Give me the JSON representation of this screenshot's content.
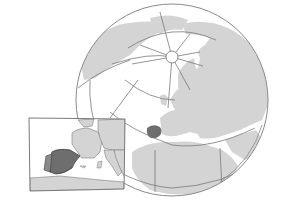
{
  "map": {
    "type": "locator-globe",
    "projection": "orthographic",
    "highlighted_region": "Iberian Peninsula",
    "colors": {
      "background": "#ffffff",
      "ocean": "#ffffff",
      "land": "#d4d4d4",
      "highlight": "#6e6e6e",
      "outline": "#8a8a8a",
      "graticule": "#7a7a7a"
    },
    "globe": {
      "cx": 172,
      "cy": 100,
      "r": 96
    },
    "north_pole": {
      "cx": 172,
      "cy": 57,
      "r": 7
    },
    "inset": {
      "description": "Western Europe detail with Spain highlighted",
      "frame": {
        "x": 28,
        "y": 118,
        "w": 97,
        "h": 72
      }
    }
  }
}
